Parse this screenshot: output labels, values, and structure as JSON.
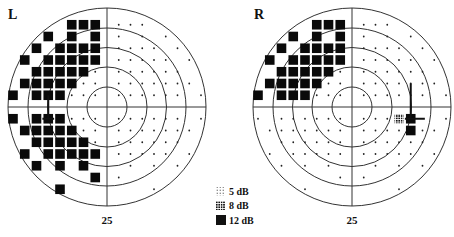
{
  "chart_data": {
    "type": "visual_field_perimetry",
    "title": "",
    "grid_spacing_units": 1,
    "legend": [
      {
        "label": "5 dB",
        "symbol": "sparse-dotted-square"
      },
      {
        "label": "8 dB",
        "symbol": "dense-dotted-square"
      },
      {
        "label": "12 dB",
        "symbol": "solid-square"
      }
    ],
    "fields": [
      {
        "eye": "L",
        "scale_label": "25",
        "rings": 5,
        "blind_spot_cross": {
          "x": -5,
          "y_from": 1,
          "y_to": -1,
          "h_y": -1,
          "h_x_from": -5.5,
          "h_x_to": -4.5
        },
        "points": {
          "12dB": [
            [
              -3,
              7
            ],
            [
              -2,
              7
            ],
            [
              -1,
              7
            ],
            [
              -5,
              6
            ],
            [
              -3,
              6
            ],
            [
              -1,
              6
            ],
            [
              -6,
              5
            ],
            [
              -4,
              5
            ],
            [
              -3,
              5
            ],
            [
              -2,
              5
            ],
            [
              -1,
              5
            ],
            [
              -7,
              4
            ],
            [
              -5,
              4
            ],
            [
              -4,
              4
            ],
            [
              -3,
              4
            ],
            [
              -2,
              4
            ],
            [
              -1,
              4
            ],
            [
              -6,
              3
            ],
            [
              -5,
              3
            ],
            [
              -4,
              3
            ],
            [
              -3,
              3
            ],
            [
              -2,
              3
            ],
            [
              -7,
              2
            ],
            [
              -6,
              2
            ],
            [
              -5,
              2
            ],
            [
              -4,
              2
            ],
            [
              -3,
              2
            ],
            [
              -8,
              1
            ],
            [
              -6,
              1
            ],
            [
              -5,
              1
            ],
            [
              -4,
              1
            ],
            [
              -8,
              -1
            ],
            [
              -6,
              -1
            ],
            [
              -5,
              -1
            ],
            [
              -4,
              -1
            ],
            [
              -7,
              -2
            ],
            [
              -6,
              -2
            ],
            [
              -5,
              -2
            ],
            [
              -4,
              -2
            ],
            [
              -3,
              -2
            ],
            [
              -6,
              -3
            ],
            [
              -5,
              -3
            ],
            [
              -4,
              -3
            ],
            [
              -3,
              -3
            ],
            [
              -2,
              -3
            ],
            [
              -7,
              -4
            ],
            [
              -5,
              -4
            ],
            [
              -4,
              -4
            ],
            [
              -3,
              -4
            ],
            [
              -2,
              -4
            ],
            [
              -1,
              -4
            ],
            [
              -6,
              -5
            ],
            [
              -4,
              -5
            ],
            [
              -2,
              -5
            ],
            [
              -1,
              -6
            ],
            [
              -4,
              -7
            ]
          ],
          "8dB": [],
          "5dB": [],
          "normal": [
            [
              1,
              7
            ],
            [
              2,
              7
            ],
            [
              3,
              7
            ],
            [
              1,
              6
            ],
            [
              3,
              6
            ],
            [
              5,
              6
            ],
            [
              1,
              5
            ],
            [
              2,
              5
            ],
            [
              3,
              5
            ],
            [
              4,
              5
            ],
            [
              6,
              5
            ],
            [
              1,
              4
            ],
            [
              2,
              4
            ],
            [
              3,
              4
            ],
            [
              4,
              4
            ],
            [
              5,
              4
            ],
            [
              7,
              4
            ],
            [
              1,
              3
            ],
            [
              2,
              3
            ],
            [
              3,
              3
            ],
            [
              4,
              3
            ],
            [
              5,
              3
            ],
            [
              6,
              3
            ],
            [
              -2,
              3
            ],
            [
              -1,
              3
            ],
            [
              1,
              2
            ],
            [
              2,
              2
            ],
            [
              3,
              2
            ],
            [
              4,
              2
            ],
            [
              5,
              2
            ],
            [
              6,
              2
            ],
            [
              7,
              2
            ],
            [
              -2,
              2
            ],
            [
              -1,
              2
            ],
            [
              -3,
              1
            ],
            [
              -2,
              1
            ],
            [
              -1,
              1
            ],
            [
              1,
              1
            ],
            [
              2,
              1
            ],
            [
              3,
              1
            ],
            [
              4,
              1
            ],
            [
              5,
              1
            ],
            [
              6,
              1
            ],
            [
              8,
              1
            ],
            [
              -3,
              -1
            ],
            [
              -2,
              -1
            ],
            [
              -1,
              -1
            ],
            [
              1,
              -1
            ],
            [
              2,
              -1
            ],
            [
              3,
              -1
            ],
            [
              4,
              -1
            ],
            [
              5,
              -1
            ],
            [
              6,
              -1
            ],
            [
              8,
              -1
            ],
            [
              -2,
              -2
            ],
            [
              -1,
              -2
            ],
            [
              1,
              -2
            ],
            [
              2,
              -2
            ],
            [
              3,
              -2
            ],
            [
              4,
              -2
            ],
            [
              5,
              -2
            ],
            [
              6,
              -2
            ],
            [
              7,
              -2
            ],
            [
              -1,
              -3
            ],
            [
              1,
              -3
            ],
            [
              2,
              -3
            ],
            [
              3,
              -3
            ],
            [
              4,
              -3
            ],
            [
              5,
              -3
            ],
            [
              6,
              -3
            ],
            [
              1,
              -4
            ],
            [
              2,
              -4
            ],
            [
              3,
              -4
            ],
            [
              4,
              -4
            ],
            [
              5,
              -4
            ],
            [
              7,
              -4
            ],
            [
              2,
              -5
            ],
            [
              4,
              -5
            ],
            [
              6,
              -5
            ],
            [
              1,
              -6
            ],
            [
              4,
              -7
            ]
          ]
        }
      },
      {
        "eye": "R",
        "scale_label": "25",
        "rings": 5,
        "blind_spot_cross": {
          "x": 5,
          "y_from": 2,
          "y_to": -1,
          "h_y": -1,
          "h_x_from": 4.5,
          "h_x_to": 6.2
        },
        "points": {
          "12dB": [
            [
              -3,
              7
            ],
            [
              -2,
              7
            ],
            [
              -1,
              7
            ],
            [
              -5,
              6
            ],
            [
              -3,
              6
            ],
            [
              -1,
              6
            ],
            [
              -6,
              5
            ],
            [
              -4,
              5
            ],
            [
              -3,
              5
            ],
            [
              -2,
              5
            ],
            [
              -1,
              5
            ],
            [
              -7,
              4
            ],
            [
              -5,
              4
            ],
            [
              -4,
              4
            ],
            [
              -3,
              4
            ],
            [
              -2,
              4
            ],
            [
              -1,
              4
            ],
            [
              -6,
              3
            ],
            [
              -5,
              3
            ],
            [
              -4,
              3
            ],
            [
              -3,
              3
            ],
            [
              -2,
              3
            ],
            [
              -7,
              2
            ],
            [
              -6,
              2
            ],
            [
              -5,
              2
            ],
            [
              -4,
              2
            ],
            [
              -3,
              2
            ],
            [
              -8,
              1
            ],
            [
              -6,
              1
            ],
            [
              -5,
              1
            ],
            [
              -4,
              1
            ],
            [
              5,
              -1
            ],
            [
              5,
              -2
            ]
          ],
          "8dB": [
            [
              4,
              -1
            ]
          ],
          "5dB": [],
          "normal": [
            [
              1,
              7
            ],
            [
              2,
              7
            ],
            [
              3,
              7
            ],
            [
              1,
              6
            ],
            [
              3,
              6
            ],
            [
              5,
              6
            ],
            [
              1,
              5
            ],
            [
              2,
              5
            ],
            [
              3,
              5
            ],
            [
              4,
              5
            ],
            [
              6,
              5
            ],
            [
              1,
              4
            ],
            [
              2,
              4
            ],
            [
              3,
              4
            ],
            [
              4,
              4
            ],
            [
              5,
              4
            ],
            [
              7,
              4
            ],
            [
              -1,
              3
            ],
            [
              1,
              3
            ],
            [
              2,
              3
            ],
            [
              3,
              3
            ],
            [
              4,
              3
            ],
            [
              5,
              3
            ],
            [
              6,
              3
            ],
            [
              -2,
              2
            ],
            [
              -1,
              2
            ],
            [
              1,
              2
            ],
            [
              2,
              2
            ],
            [
              3,
              2
            ],
            [
              4,
              2
            ],
            [
              5,
              2
            ],
            [
              6,
              2
            ],
            [
              7,
              2
            ],
            [
              -3,
              1
            ],
            [
              -2,
              1
            ],
            [
              -1,
              1
            ],
            [
              1,
              1
            ],
            [
              2,
              1
            ],
            [
              3,
              1
            ],
            [
              4,
              1
            ],
            [
              5,
              1
            ],
            [
              6,
              1
            ],
            [
              8,
              1
            ],
            [
              -8,
              -1
            ],
            [
              -6,
              -1
            ],
            [
              -5,
              -1
            ],
            [
              -4,
              -1
            ],
            [
              -3,
              -1
            ],
            [
              -2,
              -1
            ],
            [
              -1,
              -1
            ],
            [
              1,
              -1
            ],
            [
              2,
              -1
            ],
            [
              3,
              -1
            ],
            [
              8,
              -1
            ],
            [
              -7,
              -2
            ],
            [
              -6,
              -2
            ],
            [
              -5,
              -2
            ],
            [
              -4,
              -2
            ],
            [
              -3,
              -2
            ],
            [
              -2,
              -2
            ],
            [
              -1,
              -2
            ],
            [
              1,
              -2
            ],
            [
              2,
              -2
            ],
            [
              3,
              -2
            ],
            [
              4,
              -2
            ],
            [
              6,
              -2
            ],
            [
              7,
              -2
            ],
            [
              -6,
              -3
            ],
            [
              -5,
              -3
            ],
            [
              -4,
              -3
            ],
            [
              -3,
              -3
            ],
            [
              -2,
              -3
            ],
            [
              -1,
              -3
            ],
            [
              1,
              -3
            ],
            [
              2,
              -3
            ],
            [
              3,
              -3
            ],
            [
              4,
              -3
            ],
            [
              5,
              -3
            ],
            [
              6,
              -3
            ],
            [
              -7,
              -4
            ],
            [
              -5,
              -4
            ],
            [
              -4,
              -4
            ],
            [
              -3,
              -4
            ],
            [
              -2,
              -4
            ],
            [
              -1,
              -4
            ],
            [
              1,
              -4
            ],
            [
              2,
              -4
            ],
            [
              3,
              -4
            ],
            [
              4,
              -4
            ],
            [
              5,
              -4
            ],
            [
              7,
              -4
            ],
            [
              -6,
              -5
            ],
            [
              -4,
              -5
            ],
            [
              -2,
              -5
            ],
            [
              2,
              -5
            ],
            [
              4,
              -5
            ],
            [
              6,
              -5
            ],
            [
              -1,
              -6
            ],
            [
              1,
              -6
            ],
            [
              -4,
              -7
            ],
            [
              4,
              -7
            ]
          ]
        }
      }
    ]
  },
  "figure": {
    "left_eye_label": "L",
    "right_eye_label": "R",
    "left_scale_label": "25",
    "right_scale_label": "25",
    "legend": {
      "items": [
        {
          "label": "5 dB"
        },
        {
          "label": "8 dB"
        },
        {
          "label": "12 dB"
        }
      ]
    }
  }
}
